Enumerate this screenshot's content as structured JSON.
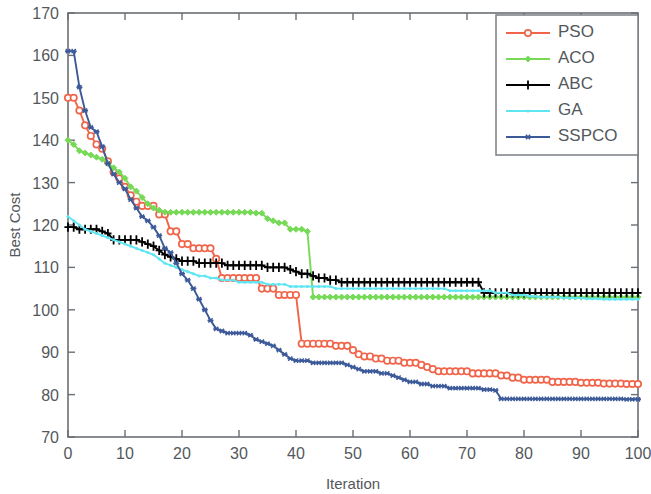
{
  "figure": {
    "width": 651,
    "height": 494,
    "background": "#ffffff"
  },
  "axes": {
    "x_title": "Iteration",
    "y_title": "Best Cost",
    "x_ticks": [
      "0",
      "10",
      "20",
      "30",
      "40",
      "50",
      "60",
      "70",
      "80",
      "90",
      "100"
    ],
    "y_ticks": [
      "70",
      "80",
      "90",
      "100",
      "110",
      "120",
      "130",
      "140",
      "150",
      "160",
      "170"
    ],
    "axis_color": "#6b6f73",
    "label_color": "#53585c"
  },
  "legend": {
    "position": "top-right",
    "border_color": "#7a7f84",
    "entries": [
      {
        "label": "PSO",
        "color": "#f0654a",
        "marker": "circle"
      },
      {
        "label": "ACO",
        "color": "#76da57",
        "marker": "diamond"
      },
      {
        "label": "ABC",
        "color": "#000000",
        "marker": "plus"
      },
      {
        "label": "GA",
        "color": "#5fe6f2",
        "marker": "dot"
      },
      {
        "label": "SSPCO",
        "color": "#3c5a99",
        "marker": "asterisk"
      }
    ]
  },
  "chart_data": {
    "type": "line",
    "title": "",
    "xlabel": "Iteration",
    "ylabel": "Best Cost",
    "xlim": [
      0,
      100
    ],
    "ylim": [
      70,
      170
    ],
    "grid": false,
    "legend_position": "top-right",
    "x": [
      0,
      1,
      2,
      3,
      4,
      5,
      6,
      7,
      8,
      9,
      10,
      11,
      12,
      13,
      14,
      15,
      16,
      17,
      18,
      19,
      20,
      21,
      22,
      23,
      24,
      25,
      26,
      27,
      28,
      29,
      30,
      31,
      32,
      33,
      34,
      35,
      36,
      37,
      38,
      39,
      40,
      41,
      42,
      43,
      44,
      45,
      46,
      47,
      48,
      49,
      50,
      51,
      52,
      53,
      54,
      55,
      56,
      57,
      58,
      59,
      60,
      61,
      62,
      63,
      64,
      65,
      66,
      67,
      68,
      69,
      70,
      71,
      72,
      73,
      74,
      75,
      76,
      77,
      78,
      79,
      80,
      81,
      82,
      83,
      84,
      85,
      86,
      87,
      88,
      89,
      90,
      91,
      92,
      93,
      94,
      95,
      96,
      97,
      98,
      99,
      100
    ],
    "series": [
      {
        "name": "PSO",
        "color": "#f0654a",
        "marker": "circle",
        "values": [
          150.0,
          150.0,
          147.0,
          143.5,
          141.0,
          139.0,
          138.0,
          135.0,
          132.5,
          131.0,
          129.0,
          127.0,
          125.5,
          124.5,
          124.5,
          124.5,
          122.5,
          122.5,
          118.5,
          118.5,
          115.5,
          115.5,
          114.5,
          114.5,
          114.5,
          114.5,
          112.0,
          107.5,
          107.5,
          107.5,
          107.5,
          107.5,
          107.5,
          107.5,
          105.0,
          105.0,
          105.0,
          103.5,
          103.5,
          103.5,
          103.5,
          92.0,
          92.0,
          92.0,
          92.0,
          92.0,
          92.0,
          91.5,
          91.5,
          91.5,
          90.5,
          89.5,
          89.0,
          89.0,
          88.5,
          88.5,
          88.0,
          88.0,
          88.0,
          87.5,
          87.5,
          87.5,
          87.0,
          86.5,
          86.0,
          85.5,
          85.5,
          85.5,
          85.5,
          85.5,
          85.5,
          85.0,
          85.0,
          85.0,
          85.0,
          85.0,
          84.5,
          84.5,
          84.0,
          84.0,
          83.5,
          83.5,
          83.5,
          83.5,
          83.5,
          83.0,
          83.0,
          83.0,
          83.0,
          83.0,
          82.8,
          82.8,
          82.8,
          82.8,
          82.6,
          82.6,
          82.6,
          82.6,
          82.5,
          82.5,
          82.5
        ]
      },
      {
        "name": "ACO",
        "color": "#76da57",
        "marker": "diamond",
        "values": [
          140.0,
          139.0,
          137.5,
          137.0,
          136.5,
          136.0,
          135.5,
          134.5,
          133.5,
          132.5,
          131.0,
          129.0,
          128.0,
          126.5,
          125.0,
          124.0,
          123.5,
          123.0,
          123.0,
          123.0,
          123.0,
          123.0,
          123.0,
          123.0,
          123.0,
          123.0,
          123.0,
          123.0,
          123.0,
          123.0,
          123.0,
          123.0,
          123.0,
          122.8,
          122.8,
          121.5,
          121.0,
          120.5,
          120.5,
          119.0,
          119.0,
          119.0,
          118.5,
          103.0,
          103.0,
          103.0,
          103.0,
          103.0,
          103.0,
          103.0,
          103.0,
          103.0,
          103.0,
          103.0,
          103.0,
          103.0,
          103.0,
          103.0,
          103.0,
          103.0,
          103.0,
          103.0,
          103.0,
          103.0,
          103.0,
          103.0,
          103.0,
          103.0,
          103.0,
          103.0,
          103.0,
          103.0,
          103.0,
          103.0,
          103.0,
          103.0,
          103.0,
          103.0,
          103.0,
          103.0,
          103.0,
          103.0,
          103.0,
          103.0,
          103.0,
          103.0,
          103.0,
          103.0,
          103.0,
          103.0,
          103.0,
          103.0,
          103.0,
          103.0,
          103.0,
          103.0,
          103.0,
          103.0,
          103.0,
          103.0,
          103.0
        ]
      },
      {
        "name": "ABC",
        "color": "#000000",
        "marker": "plus",
        "values": [
          119.5,
          119.5,
          119.0,
          119.0,
          119.0,
          119.0,
          118.5,
          118.0,
          116.5,
          116.5,
          116.5,
          116.5,
          116.5,
          116.0,
          115.5,
          115.0,
          114.0,
          113.0,
          112.5,
          112.0,
          111.5,
          111.5,
          111.5,
          111.0,
          111.0,
          111.0,
          111.0,
          111.0,
          110.5,
          110.5,
          110.5,
          110.5,
          110.5,
          110.5,
          110.5,
          110.0,
          110.0,
          110.0,
          110.0,
          109.5,
          109.0,
          108.5,
          108.5,
          108.0,
          107.5,
          107.5,
          107.0,
          107.0,
          106.5,
          106.5,
          106.5,
          106.5,
          106.5,
          106.5,
          106.5,
          106.5,
          106.5,
          106.5,
          106.5,
          106.5,
          106.5,
          106.5,
          106.5,
          106.5,
          106.5,
          106.5,
          106.5,
          106.5,
          106.5,
          106.5,
          106.5,
          106.5,
          106.5,
          104.0,
          104.0,
          104.0,
          104.0,
          104.0,
          104.0,
          104.0,
          104.0,
          104.0,
          104.0,
          104.0,
          104.0,
          104.0,
          104.0,
          104.0,
          104.0,
          104.0,
          104.0,
          104.0,
          104.0,
          104.0,
          104.0,
          104.0,
          104.0,
          104.0,
          104.0,
          104.0,
          104.0
        ]
      },
      {
        "name": "GA",
        "color": "#5fe6f2",
        "marker": "dot",
        "values": [
          122.0,
          121.0,
          120.0,
          119.0,
          118.5,
          118.0,
          117.5,
          117.0,
          116.5,
          116.0,
          115.5,
          115.0,
          114.5,
          114.0,
          113.5,
          113.0,
          112.0,
          111.0,
          110.5,
          110.0,
          109.5,
          109.0,
          108.5,
          108.0,
          108.0,
          107.5,
          107.5,
          107.0,
          107.0,
          107.0,
          106.5,
          106.5,
          106.5,
          106.5,
          106.5,
          106.0,
          106.0,
          106.0,
          106.0,
          105.5,
          105.5,
          105.5,
          105.5,
          105.5,
          105.5,
          105.5,
          105.5,
          105.0,
          105.0,
          105.0,
          105.0,
          105.0,
          105.0,
          105.0,
          105.0,
          105.0,
          105.0,
          105.0,
          105.0,
          105.0,
          105.0,
          105.0,
          105.0,
          105.0,
          105.0,
          105.0,
          105.0,
          104.5,
          104.5,
          104.5,
          104.5,
          104.5,
          104.5,
          104.5,
          104.5,
          104.0,
          104.0,
          104.0,
          103.5,
          103.5,
          103.5,
          103.2,
          103.2,
          103.0,
          103.0,
          103.0,
          103.0,
          102.8,
          102.8,
          102.8,
          102.8,
          102.6,
          102.6,
          102.6,
          102.5,
          102.5,
          102.5,
          102.5,
          102.5,
          102.5,
          102.5
        ]
      },
      {
        "name": "SSPCO",
        "color": "#3c5a99",
        "marker": "asterisk",
        "values": [
          161.0,
          161.0,
          152.5,
          147.0,
          143.0,
          142.0,
          138.5,
          134.5,
          132.0,
          130.0,
          128.5,
          126.0,
          124.0,
          122.0,
          121.0,
          119.5,
          117.5,
          114.5,
          113.5,
          111.0,
          108.5,
          107.0,
          105.0,
          102.5,
          100.0,
          97.5,
          95.5,
          95.0,
          94.5,
          94.5,
          94.5,
          94.5,
          94.0,
          93.0,
          92.5,
          92.0,
          91.5,
          90.5,
          89.5,
          88.5,
          88.0,
          88.0,
          88.0,
          87.5,
          87.5,
          87.5,
          87.5,
          87.5,
          87.5,
          87.0,
          86.5,
          86.0,
          85.5,
          85.5,
          85.5,
          85.0,
          85.0,
          84.5,
          84.0,
          83.5,
          83.0,
          83.0,
          82.5,
          82.5,
          82.0,
          82.0,
          82.0,
          81.5,
          81.5,
          81.5,
          81.5,
          81.5,
          81.5,
          81.2,
          81.2,
          81.0,
          79.0,
          79.0,
          79.0,
          79.0,
          79.0,
          79.0,
          79.0,
          79.0,
          79.0,
          79.0,
          79.0,
          79.0,
          79.0,
          79.0,
          79.0,
          79.0,
          79.0,
          79.0,
          79.0,
          79.0,
          79.0,
          79.0,
          78.9,
          78.9,
          78.9
        ]
      }
    ]
  }
}
